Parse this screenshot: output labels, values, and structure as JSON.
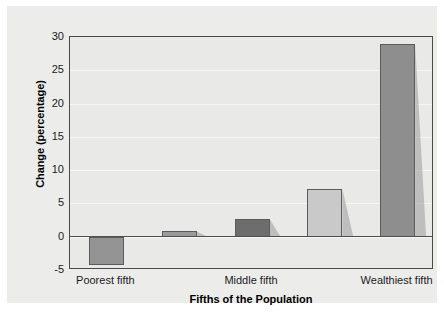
{
  "chart_data": {
    "type": "bar",
    "title": "",
    "xlabel": "Fifths of the Population",
    "ylabel": "Change (percentage)",
    "categories": [
      "Poorest fifth",
      "Second fifth",
      "Middle fifth",
      "Fourth fifth",
      "Wealthiest fifth"
    ],
    "tick_labels": [
      "Poorest fifth",
      "Middle fifth",
      "Wealthiest fifth"
    ],
    "tick_label_categories": [
      0,
      2,
      4
    ],
    "values": [
      -4.2,
      0.8,
      2.7,
      7.2,
      29.0
    ],
    "ylim": [
      -5,
      30
    ],
    "yticks": [
      30,
      25,
      20,
      15,
      10,
      5,
      0,
      -5
    ],
    "ytick_labels": [
      "30",
      "25",
      "20",
      "15",
      "10",
      "5",
      "0",
      "-5"
    ],
    "grid": true,
    "grid_axis": "y",
    "legend": "none",
    "bar_colors": [
      "#949494",
      "#9a9a9a",
      "#6d6d6d",
      "#c9c9c9",
      "#8e8e8e"
    ],
    "bar_edge_color": "#5b5b5b",
    "plot_background": "#e9e9e8",
    "panel_background": "#ececeb",
    "page_background": "#ffffff",
    "axis_color": "#4a4a4a",
    "gridline_color": "#f6f6f6",
    "zero_line_color": "#4f4f4f",
    "shadow_color": "#9a9a9a"
  },
  "axes": {
    "y_title": "Change (percentage)",
    "x_title": "Fifths of the Population"
  }
}
